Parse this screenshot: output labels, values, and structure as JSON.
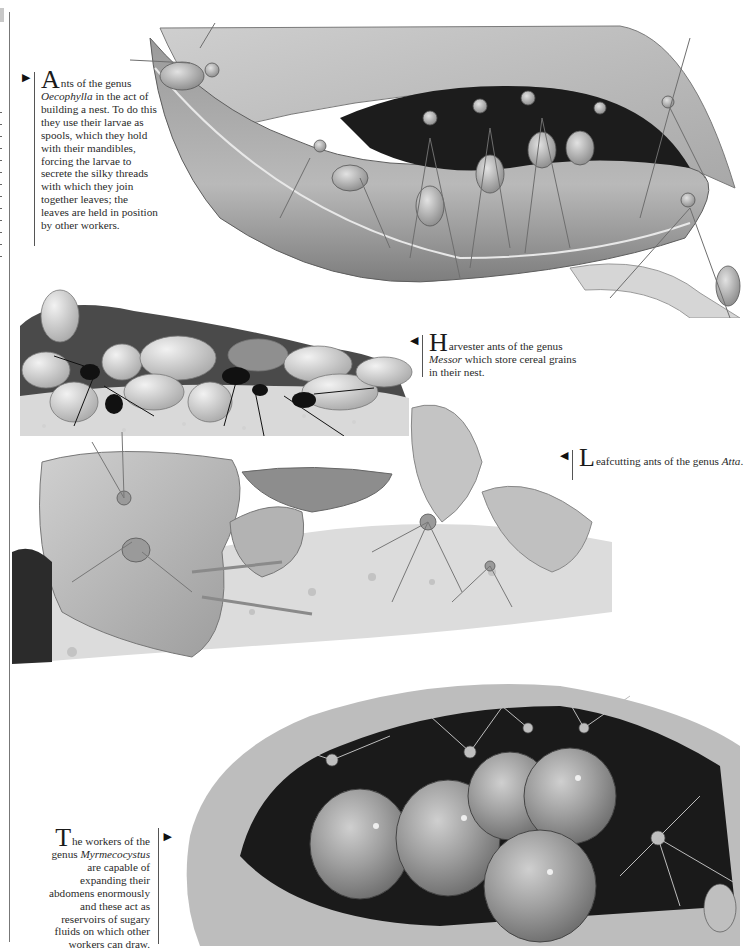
{
  "page": {
    "background": "#ffffff",
    "tone": "grayscale"
  },
  "captions": {
    "oecophylla": {
      "dropcap": "A",
      "text_before": "nts of the genus ",
      "genus": "Oecophylla",
      "text_after": " in the act of building a nest. To do this they use their larvae as spools, which they hold with their mandibles, forcing the larvae to secrete the silky threads with which they join together leaves; the leaves are held in position by other workers.",
      "pointer": "right"
    },
    "messor": {
      "dropcap": "H",
      "text_before": "arvester ants of the genus ",
      "genus": "Messor",
      "text_after": " which store cereal grains in their nest.",
      "pointer": "left"
    },
    "atta": {
      "dropcap": "L",
      "text_before": "eafcutting ants of the genus ",
      "genus": "Atta",
      "text_after": ".",
      "pointer": "left"
    },
    "myrmecocystus": {
      "dropcap": "T",
      "text_before": "he workers of the genus ",
      "genus": "Myrmecocystus",
      "text_after": " are capable of expanding their abdomens enormously and these act as reservoirs of sugary fluids on which other workers can draw.",
      "pointer": "right"
    }
  },
  "illustrations": [
    {
      "id": "weaver-ants-leaf-nest",
      "subject": "Oecophylla weaver ants pulling leaves together"
    },
    {
      "id": "harvester-ants-grain-store",
      "subject": "Messor harvester ants among cereal grains"
    },
    {
      "id": "leafcutter-ants",
      "subject": "Atta leafcutter ants carrying leaf fragments"
    },
    {
      "id": "honeypot-ants",
      "subject": "Myrmecocystus repletes with swollen abdomens hanging in a chamber"
    }
  ],
  "glyphs": {
    "pointer_right": "▶",
    "pointer_left": "◀"
  }
}
